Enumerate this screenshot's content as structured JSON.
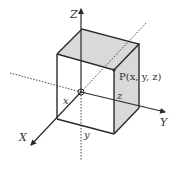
{
  "diagram": {
    "type": "3d-coordinate-box",
    "axes": {
      "x_label": "X",
      "y_label": "Y",
      "z_label": "Z"
    },
    "point_label": "P(x, y, z)",
    "dimension_labels": {
      "x": "x",
      "y": "y",
      "z": "z"
    },
    "colors": {
      "line": "#2a2a2a",
      "shaded_face": "#d9d9d9",
      "dotted": "#444444",
      "background": "#ffffff"
    }
  }
}
